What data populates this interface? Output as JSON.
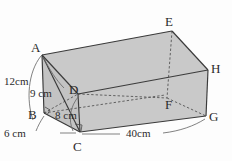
{
  "figure": {
    "shape_type": "prism",
    "colors": {
      "line": "#3a3a3a",
      "face_shade": "#c9c9c9",
      "face_top": "#ffffff",
      "label_text": "#2b2b2b",
      "background": "#fdfdfd"
    },
    "vertices": [
      {
        "name": "A",
        "label": "A",
        "x": 33,
        "y": 48
      },
      {
        "name": "B",
        "label": "B",
        "x": 30,
        "y": 114
      },
      {
        "name": "C",
        "label": "C",
        "x": 76,
        "y": 141
      },
      {
        "name": "D",
        "label": "D",
        "x": 74,
        "y": 89
      },
      {
        "name": "E",
        "label": "E",
        "x": 166,
        "y": 22
      },
      {
        "name": "F",
        "label": "F",
        "x": 165,
        "y": 101
      },
      {
        "name": "G",
        "label": "G",
        "x": 210,
        "y": 116
      },
      {
        "name": "H",
        "label": "H",
        "x": 212,
        "y": 67
      }
    ],
    "dimensions": [
      {
        "name": "height-12cm",
        "label": "12cm",
        "x": 8,
        "y": 78,
        "edge": "A-B"
      },
      {
        "name": "height-9cm",
        "label": "9 cm",
        "x": 34,
        "y": 90,
        "edge": "A-D"
      },
      {
        "name": "depth-8cm",
        "label": "8 cm",
        "x": 59,
        "y": 112,
        "edge": "D-C"
      },
      {
        "name": "width-6cm",
        "label": "6 cm",
        "x": 7,
        "y": 130,
        "edge": "B-C"
      },
      {
        "name": "length-40cm",
        "label": "40cm",
        "x": 131,
        "y": 131,
        "edge": "C-G"
      }
    ]
  }
}
